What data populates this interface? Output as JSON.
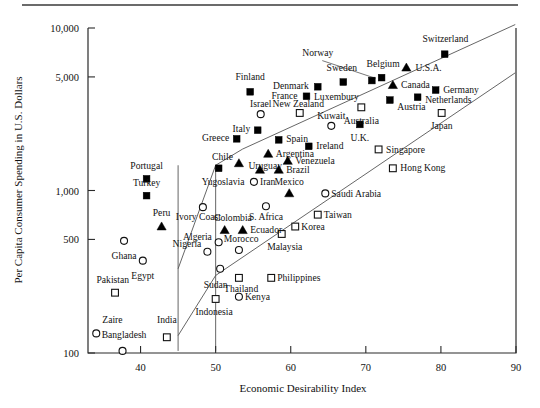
{
  "chart_data": {
    "type": "scatter",
    "title": "",
    "xlabel": "Economic Desirability Index",
    "ylabel": "Per Capita Consumer Spending in U.S. Dollars",
    "xlim": [
      33,
      90
    ],
    "ylim": [
      100,
      10000
    ],
    "yscale": "log",
    "grid": false,
    "legend": "none",
    "xticks": [
      "40",
      "50",
      "60",
      "70",
      "80",
      "90"
    ],
    "xtick_values": [
      40,
      50,
      60,
      70,
      80,
      90
    ],
    "yticks": [
      "100",
      "500",
      "1,000",
      "5,000",
      "10,000"
    ],
    "ytick_values": [
      100,
      500,
      1000,
      5000,
      10000
    ],
    "marker_shapes": [
      "filled-square",
      "filled-triangle",
      "open-circle",
      "open-square"
    ],
    "points": [
      {
        "label": "Switzerland",
        "x": 80.5,
        "y": 6900,
        "marker": "filled-square",
        "lx": 80.6,
        "ly": 8600,
        "anchor": "middle"
      },
      {
        "label": "U.S.A.",
        "x": 75.4,
        "y": 5700,
        "marker": "filled-triangle",
        "lx": 76.6,
        "ly": 5750,
        "anchor": "start"
      },
      {
        "label": "Norway",
        "x": 70.8,
        "y": 4750,
        "marker": "filled-square",
        "lx": 63.6,
        "ly": 7100,
        "anchor": "middle"
      },
      {
        "label": "Belgium",
        "x": 72.1,
        "y": 4950,
        "marker": "filled-square",
        "lx": 72.3,
        "ly": 6050,
        "anchor": "middle"
      },
      {
        "label": "Sweden",
        "x": 67.0,
        "y": 4650,
        "marker": "filled-square",
        "lx": 66.8,
        "ly": 5750,
        "anchor": "middle"
      },
      {
        "label": "Canada",
        "x": 73.6,
        "y": 4450,
        "marker": "filled-triangle",
        "lx": 74.7,
        "ly": 4500,
        "anchor": "start"
      },
      {
        "label": "Germany",
        "x": 79.3,
        "y": 4150,
        "marker": "filled-square",
        "lx": 80.3,
        "ly": 4200,
        "anchor": "start"
      },
      {
        "label": "Denmark",
        "x": 63.6,
        "y": 4350,
        "marker": "filled-square",
        "lx": 62.4,
        "ly": 4420,
        "anchor": "end"
      },
      {
        "label": "France",
        "x": 62.1,
        "y": 3800,
        "marker": "filled-square",
        "lx": 60.9,
        "ly": 3860,
        "anchor": "end"
      },
      {
        "label": "Luxembury",
        "x": 62.1,
        "y": 3800,
        "marker": "none",
        "lx": 63.1,
        "ly": 3800,
        "anchor": "start"
      },
      {
        "label": "Austria",
        "x": 73.2,
        "y": 3600,
        "marker": "filled-square",
        "lx": 74.2,
        "ly": 3300,
        "anchor": "start"
      },
      {
        "label": "Netherlands",
        "x": 76.9,
        "y": 3750,
        "marker": "filled-square",
        "lx": 77.9,
        "ly": 3620,
        "anchor": "start"
      },
      {
        "label": "Finland",
        "x": 54.6,
        "y": 4050,
        "marker": "filled-square",
        "lx": 54.6,
        "ly": 5000,
        "anchor": "middle"
      },
      {
        "label": "Australia",
        "x": 69.4,
        "y": 3250,
        "marker": "open-square",
        "lx": 69.4,
        "ly": 2700,
        "anchor": "middle"
      },
      {
        "label": "Japan",
        "x": 80.1,
        "y": 3000,
        "marker": "open-square",
        "lx": 80.1,
        "ly": 2500,
        "anchor": "middle"
      },
      {
        "label": "New Zealand",
        "x": 61.2,
        "y": 3000,
        "marker": "open-square",
        "lx": 61.0,
        "ly": 3430,
        "anchor": "middle"
      },
      {
        "label": "Israel",
        "x": 56.0,
        "y": 2950,
        "marker": "open-circle",
        "lx": 56.0,
        "ly": 3430,
        "anchor": "middle"
      },
      {
        "label": "Kuwait",
        "x": 65.4,
        "y": 2500,
        "marker": "open-circle",
        "lx": 65.4,
        "ly": 2900,
        "anchor": "middle"
      },
      {
        "label": "U.K.",
        "x": 69.2,
        "y": 2550,
        "marker": "filled-square",
        "lx": 69.2,
        "ly": 2130,
        "anchor": "middle"
      },
      {
        "label": "Italy",
        "x": 55.6,
        "y": 2350,
        "marker": "filled-square",
        "lx": 54.6,
        "ly": 2400,
        "anchor": "end"
      },
      {
        "label": "Spain",
        "x": 58.4,
        "y": 2050,
        "marker": "filled-square",
        "lx": 59.4,
        "ly": 2080,
        "anchor": "start"
      },
      {
        "label": "Greece",
        "x": 52.8,
        "y": 2080,
        "marker": "filled-square",
        "lx": 51.8,
        "ly": 2120,
        "anchor": "end"
      },
      {
        "label": "Ireland",
        "x": 62.4,
        "y": 1870,
        "marker": "filled-square",
        "lx": 63.4,
        "ly": 1880,
        "anchor": "start"
      },
      {
        "label": "Singapore",
        "x": 71.7,
        "y": 1790,
        "marker": "open-square",
        "lx": 72.7,
        "ly": 1800,
        "anchor": "start"
      },
      {
        "label": "Argentina",
        "x": 57.0,
        "y": 1680,
        "marker": "filled-triangle",
        "lx": 58.0,
        "ly": 1700,
        "anchor": "start"
      },
      {
        "label": "Venezuela",
        "x": 59.6,
        "y": 1520,
        "marker": "filled-triangle",
        "lx": 60.6,
        "ly": 1530,
        "anchor": "start"
      },
      {
        "label": "Hong Kong",
        "x": 73.6,
        "y": 1370,
        "marker": "open-square",
        "lx": 74.6,
        "ly": 1380,
        "anchor": "start"
      },
      {
        "label": "Chile",
        "x": 53.1,
        "y": 1470,
        "marker": "filled-triangle",
        "lx": 52.3,
        "ly": 1620,
        "anchor": "end"
      },
      {
        "label": "Portugal",
        "x": 40.8,
        "y": 1180,
        "marker": "filled-square",
        "lx": 40.8,
        "ly": 1430,
        "anchor": "middle"
      },
      {
        "label": "Uruguay",
        "x": 55.9,
        "y": 1340,
        "marker": "filled-triangle",
        "lx": 56.6,
        "ly": 1420,
        "anchor": "middle"
      },
      {
        "label": "Brazil",
        "x": 58.4,
        "y": 1340,
        "marker": "filled-triangle",
        "lx": 59.4,
        "ly": 1350,
        "anchor": "start"
      },
      {
        "label": "Yugoslavia",
        "x": 50.4,
        "y": 1370,
        "marker": "filled-square",
        "lx": 51.0,
        "ly": 1140,
        "anchor": "middle"
      },
      {
        "label": "Iran",
        "x": 55.1,
        "y": 1130,
        "marker": "open-circle",
        "lx": 55.9,
        "ly": 1140,
        "anchor": "start"
      },
      {
        "label": "Turkey",
        "x": 40.8,
        "y": 930,
        "marker": "filled-square",
        "lx": 40.8,
        "ly": 1120,
        "anchor": "middle"
      },
      {
        "label": "Mexico",
        "x": 59.8,
        "y": 960,
        "marker": "filled-triangle",
        "lx": 59.8,
        "ly": 1130,
        "anchor": "middle"
      },
      {
        "label": "Saudi Arabia",
        "x": 64.6,
        "y": 960,
        "marker": "open-circle",
        "lx": 65.4,
        "ly": 965,
        "anchor": "start"
      },
      {
        "label": "Ivory Coast",
        "x": 48.3,
        "y": 790,
        "marker": "open-circle",
        "lx": 47.7,
        "ly": 690,
        "anchor": "middle"
      },
      {
        "label": "S. Africa",
        "x": 56.7,
        "y": 800,
        "marker": "open-circle",
        "lx": 56.7,
        "ly": 690,
        "anchor": "middle"
      },
      {
        "label": "Taiwan",
        "x": 63.6,
        "y": 710,
        "marker": "open-square",
        "lx": 64.4,
        "ly": 715,
        "anchor": "start"
      },
      {
        "label": "Peru",
        "x": 42.8,
        "y": 600,
        "marker": "filled-triangle",
        "lx": 42.8,
        "ly": 730,
        "anchor": "middle"
      },
      {
        "label": "Colombia",
        "x": 51.2,
        "y": 570,
        "marker": "filled-triangle",
        "lx": 52.3,
        "ly": 680,
        "anchor": "middle"
      },
      {
        "label": "Ecuador",
        "x": 53.6,
        "y": 570,
        "marker": "filled-triangle",
        "lx": 54.6,
        "ly": 575,
        "anchor": "start"
      },
      {
        "label": "Korea",
        "x": 60.6,
        "y": 600,
        "marker": "open-square",
        "lx": 61.4,
        "ly": 600,
        "anchor": "start"
      },
      {
        "label": "Malaysia",
        "x": 58.8,
        "y": 540,
        "marker": "open-square",
        "lx": 59.2,
        "ly": 455,
        "anchor": "middle"
      },
      {
        "label": "Algeria",
        "x": 50.4,
        "y": 480,
        "marker": "open-circle",
        "lx": 49.5,
        "ly": 520,
        "anchor": "end"
      },
      {
        "label": "Ghana",
        "x": 37.8,
        "y": 490,
        "marker": "open-circle",
        "lx": 37.8,
        "ly": 400,
        "anchor": "middle"
      },
      {
        "label": "Morocco",
        "x": 53.1,
        "y": 430,
        "marker": "open-circle",
        "lx": 53.4,
        "ly": 505,
        "anchor": "middle"
      },
      {
        "label": "Nigeria",
        "x": 48.9,
        "y": 420,
        "marker": "open-circle",
        "lx": 48.1,
        "ly": 470,
        "anchor": "end"
      },
      {
        "label": "Egypt",
        "x": 40.3,
        "y": 370,
        "marker": "open-circle",
        "lx": 40.3,
        "ly": 300,
        "anchor": "middle"
      },
      {
        "label": "Sudan",
        "x": 50.6,
        "y": 330,
        "marker": "open-circle",
        "lx": 50.0,
        "ly": 265,
        "anchor": "middle"
      },
      {
        "label": "Philippines",
        "x": 57.4,
        "y": 290,
        "marker": "open-square",
        "lx": 58.2,
        "ly": 292,
        "anchor": "start"
      },
      {
        "label": "Thailand",
        "x": 53.1,
        "y": 290,
        "marker": "open-square",
        "lx": 53.4,
        "ly": 248,
        "anchor": "middle"
      },
      {
        "label": "Pakistan",
        "x": 36.6,
        "y": 235,
        "marker": "open-square",
        "lx": 36.3,
        "ly": 285,
        "anchor": "middle"
      },
      {
        "label": "Kenya",
        "x": 53.1,
        "y": 222,
        "marker": "open-circle",
        "lx": 53.9,
        "ly": 224,
        "anchor": "start"
      },
      {
        "label": "Indonesia",
        "x": 50.0,
        "y": 215,
        "marker": "open-square",
        "lx": 49.8,
        "ly": 180,
        "anchor": "middle"
      },
      {
        "label": "Zaire",
        "x": 34.1,
        "y": 132,
        "marker": "open-circle",
        "lx": 34.9,
        "ly": 160,
        "anchor": "start"
      },
      {
        "label": "India",
        "x": 43.5,
        "y": 125,
        "marker": "open-square",
        "lx": 43.5,
        "ly": 160,
        "anchor": "middle"
      },
      {
        "label": "Bangladesh",
        "x": 37.6,
        "y": 103,
        "marker": "open-circle",
        "lx": 37.8,
        "ly": 130,
        "anchor": "middle"
      }
    ],
    "annotations": [
      {
        "name": "upper-band-polyline",
        "desc": "upper diagonal band boundary"
      },
      {
        "name": "lower-band-polyline",
        "desc": "lower diagonal band boundary"
      },
      {
        "name": "left-vertical-45",
        "desc": "vertical boundary at index 45"
      },
      {
        "name": "left-vertical-50",
        "desc": "vertical boundary at index 50"
      },
      {
        "name": "norway-leader",
        "desc": "leader line from Norway label to marker"
      }
    ]
  }
}
